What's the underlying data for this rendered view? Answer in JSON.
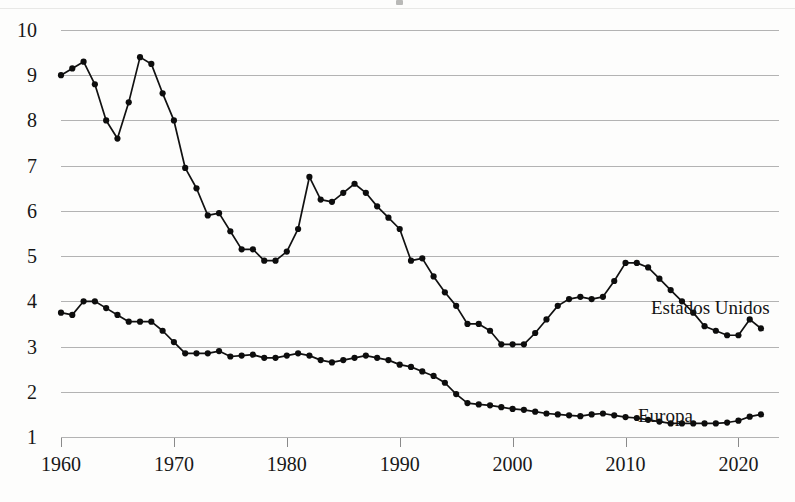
{
  "figure": {
    "background_color": "#fdfdfc",
    "line_color": "#111111",
    "gridline_color": "#b3b3b3"
  },
  "axes": {
    "y_ticks": [
      "10",
      "9",
      "8",
      "7",
      "6",
      "5",
      "4",
      "3",
      "2",
      "1"
    ],
    "x_ticks": [
      "1960",
      "1970",
      "1980",
      "1990",
      "2000",
      "2010",
      "2020"
    ]
  },
  "annotations": {
    "estados_unidos": "Estados Unidos",
    "europa": "Europa"
  },
  "chart_data": {
    "type": "line",
    "title": "",
    "subtitle": "",
    "xlabel": "",
    "ylabel": "",
    "xlim": [
      1960,
      2022
    ],
    "ylim": [
      1,
      10
    ],
    "grid": true,
    "gridlines_y": [
      1,
      2,
      3,
      4,
      5,
      6,
      7,
      8,
      9,
      10
    ],
    "x_tick_values": [
      1960,
      1970,
      1980,
      1990,
      2000,
      2010,
      2020
    ],
    "y_tick_values": [
      10,
      9,
      8,
      7,
      6,
      5,
      4,
      3,
      2,
      1
    ],
    "legend": "inline-annotations",
    "legend_position": "right-inline",
    "markers": true,
    "x": [
      1960,
      1961,
      1962,
      1963,
      1964,
      1965,
      1966,
      1967,
      1968,
      1969,
      1970,
      1971,
      1972,
      1973,
      1974,
      1975,
      1976,
      1977,
      1978,
      1979,
      1980,
      1981,
      1982,
      1983,
      1984,
      1985,
      1986,
      1987,
      1988,
      1989,
      1990,
      1991,
      1992,
      1993,
      1994,
      1995,
      1996,
      1997,
      1998,
      1999,
      2000,
      2001,
      2002,
      2003,
      2004,
      2005,
      2006,
      2007,
      2008,
      2009,
      2010,
      2011,
      2012,
      2013,
      2014,
      2015,
      2016,
      2017,
      2018,
      2019,
      2020,
      2021,
      2022
    ],
    "series": [
      {
        "name": "Estados Unidos",
        "values": [
          9.0,
          9.15,
          9.3,
          8.8,
          8.0,
          7.6,
          8.4,
          9.4,
          9.25,
          8.6,
          8.0,
          6.95,
          6.5,
          5.9,
          5.95,
          5.55,
          5.15,
          5.15,
          4.9,
          4.9,
          5.1,
          5.6,
          6.75,
          6.25,
          6.2,
          6.4,
          6.6,
          6.4,
          6.1,
          5.85,
          5.6,
          4.9,
          4.95,
          4.55,
          4.2,
          3.9,
          3.5,
          3.5,
          3.35,
          3.05,
          3.05,
          3.05,
          3.3,
          3.6,
          3.9,
          4.05,
          4.1,
          4.05,
          4.1,
          4.45,
          4.85,
          4.85,
          4.75,
          4.5,
          4.25,
          4.0,
          3.75,
          3.45,
          3.35,
          3.25,
          3.25,
          3.6,
          3.4
        ]
      },
      {
        "name": "Europa",
        "values": [
          3.75,
          3.7,
          4.0,
          4.0,
          3.85,
          3.7,
          3.55,
          3.55,
          3.55,
          3.35,
          3.1,
          2.85,
          2.85,
          2.85,
          2.9,
          2.78,
          2.8,
          2.82,
          2.75,
          2.75,
          2.8,
          2.85,
          2.8,
          2.7,
          2.65,
          2.7,
          2.75,
          2.8,
          2.75,
          2.7,
          2.6,
          2.55,
          2.45,
          2.35,
          2.2,
          1.95,
          1.75,
          1.72,
          1.7,
          1.66,
          1.62,
          1.6,
          1.56,
          1.52,
          1.5,
          1.48,
          1.46,
          1.5,
          1.52,
          1.48,
          1.44,
          1.42,
          1.38,
          1.34,
          1.3,
          1.3,
          1.3,
          1.3,
          1.3,
          1.32,
          1.36,
          1.45,
          1.5
        ]
      }
    ]
  }
}
